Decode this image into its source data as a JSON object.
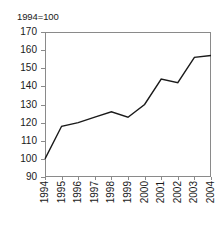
{
  "chart_data": {
    "type": "line",
    "title": "",
    "subtitle": "",
    "annotation": "1994=100",
    "xlabel": "",
    "ylabel": "",
    "categories": [
      "1994",
      "1995",
      "1996",
      "1997",
      "1998",
      "1999",
      "2000",
      "2001",
      "2002",
      "2003",
      "2004"
    ],
    "series": [
      {
        "name": "index",
        "values": [
          100,
          118,
          120,
          123,
          126,
          123,
          130,
          144,
          142,
          156,
          157
        ]
      }
    ],
    "ylim": [
      90,
      170
    ],
    "yticks": [
      90,
      100,
      110,
      120,
      130,
      140,
      150,
      160,
      170
    ],
    "ytick_labels": [
      "90",
      "100",
      "110",
      "120",
      "130",
      "140",
      "150",
      "160",
      "170"
    ],
    "xtick_labels": [
      "1994",
      "1995",
      "1996",
      "1997",
      "1998",
      "1999",
      "2000",
      "2001",
      "2002",
      "2003",
      "2004"
    ],
    "grid": false,
    "legend": false,
    "legend_position": "none",
    "line_color": "#1a1a1a",
    "axis_color": "#8a8a8a",
    "background_color": "#ffffff",
    "x_label_rotation": 90
  }
}
